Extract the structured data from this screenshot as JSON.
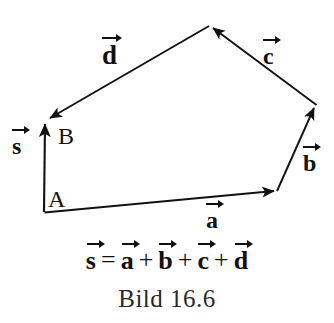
{
  "figure": {
    "caption": "Bild 16.6",
    "background_color": "#ffffff",
    "stroke_color": "#111111",
    "width": 334,
    "height": 323
  },
  "points": {
    "a_label": "A",
    "b_label": "B"
  },
  "vectors": [
    {
      "id": "s",
      "letter": "s",
      "label_x": 12,
      "label_y": 126,
      "from": "A",
      "to": "B",
      "x1": 44,
      "y1": 212,
      "x2": 45,
      "y2": 122
    },
    {
      "id": "a",
      "letter": "a",
      "label_x": 206,
      "label_y": 200,
      "from": "A",
      "to": "P1",
      "x1": 44,
      "y1": 212,
      "x2": 277,
      "y2": 191
    },
    {
      "id": "b",
      "letter": "b",
      "label_x": 303,
      "label_y": 143,
      "from": "P1",
      "to": "P2",
      "x1": 277,
      "y1": 191,
      "x2": 316,
      "y2": 105
    },
    {
      "id": "c",
      "letter": "c",
      "label_x": 263,
      "label_y": 36,
      "from": "P2",
      "to": "P3",
      "x1": 316,
      "y1": 105,
      "x2": 209,
      "y2": 26
    },
    {
      "id": "d",
      "letter": "d",
      "label_x": 102,
      "label_y": 36,
      "from": "P3",
      "to": "B",
      "x1": 209,
      "y1": 26,
      "x2": 46,
      "y2": 121
    }
  ],
  "equation": {
    "terms": [
      {
        "kind": "vector",
        "letter": "s"
      },
      {
        "kind": "op",
        "symbol": "="
      },
      {
        "kind": "vector",
        "letter": "a"
      },
      {
        "kind": "op",
        "symbol": "+"
      },
      {
        "kind": "vector",
        "letter": "b"
      },
      {
        "kind": "op",
        "symbol": "+"
      },
      {
        "kind": "vector",
        "letter": "c"
      },
      {
        "kind": "op",
        "symbol": "+"
      },
      {
        "kind": "vector",
        "letter": "d"
      }
    ],
    "text": "s = a + b + c + d"
  }
}
